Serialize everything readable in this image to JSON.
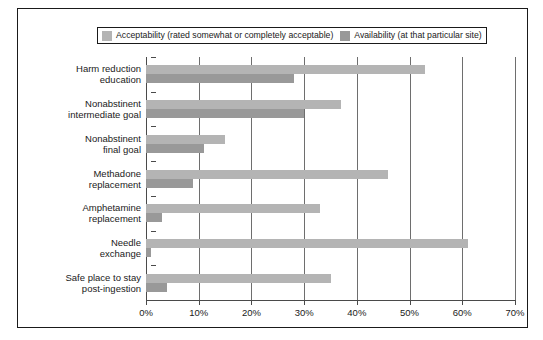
{
  "chart_data": {
    "type": "bar",
    "orientation": "horizontal",
    "title": "",
    "subtitle": "",
    "xlabel": "",
    "ylabel": "",
    "xlim": [
      0,
      70
    ],
    "xtick_labels": [
      "0%",
      "10%",
      "20%",
      "30%",
      "40%",
      "50%",
      "60%",
      "70%"
    ],
    "xtick_values": [
      0,
      10,
      20,
      30,
      40,
      50,
      60,
      70
    ],
    "grid": "vertical",
    "legend_position": "top",
    "categories": [
      "Harm reduction education",
      "Nonabstinent intermediate goal",
      "Nonabstinent final goal",
      "Methadone replacement",
      "Amphetamine replacement",
      "Needle exchange",
      "Safe place to stay post-ingestion"
    ],
    "category_lines": [
      [
        "Harm reduction",
        "education"
      ],
      [
        "Nonabstinent",
        "intermediate goal"
      ],
      [
        "Nonabstinent",
        "final goal"
      ],
      [
        "Methadone",
        "replacement"
      ],
      [
        "Amphetamine",
        "replacement"
      ],
      [
        "Needle",
        "exchange"
      ],
      [
        "Safe place to stay",
        "post-ingestion"
      ]
    ],
    "series": [
      {
        "name": "Acceptability (rated somewhat or completely acceptable)",
        "color": "#b4b4b4",
        "values": [
          53,
          37,
          15,
          46,
          33,
          61,
          35
        ]
      },
      {
        "name": "Availability (at that particular site)",
        "color": "#999999",
        "values": [
          28,
          30,
          11,
          9,
          3,
          1,
          4
        ]
      }
    ]
  },
  "legend": {
    "entries": [
      {
        "label": "Acceptability (rated somewhat or completely acceptable)"
      },
      {
        "label": "Availability (at that particular site)"
      }
    ]
  },
  "colors": {
    "series_acceptability": "#b4b4b4",
    "series_availability": "#999999",
    "axis": "#4a4a4a",
    "grid": "#6e6e6e",
    "frame": "#1a1a1a",
    "text": "#1a1a1a",
    "background": "#ffffff"
  }
}
